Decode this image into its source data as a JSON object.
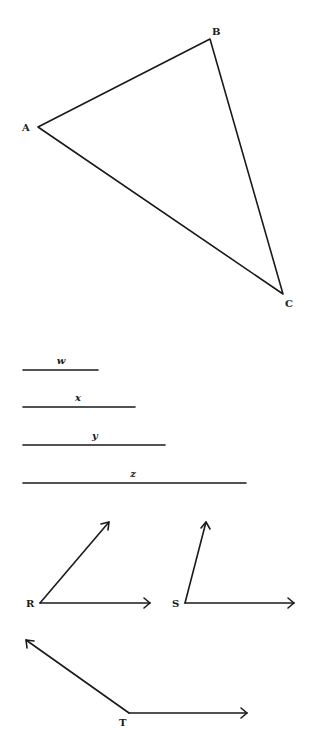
{
  "triangle": {
    "vertices": [
      {
        "label": "A",
        "x": 38,
        "y": 127,
        "lx": 22,
        "ly": 131
      },
      {
        "label": "B",
        "x": 210,
        "y": 39,
        "lx": 212,
        "ly": 35
      },
      {
        "label": "C",
        "x": 283,
        "y": 294,
        "lx": 285,
        "ly": 307
      }
    ]
  },
  "segments": [
    {
      "label": "w",
      "x1": 23,
      "x2": 98,
      "y": 370,
      "lx": 61,
      "ly": 364
    },
    {
      "label": "x",
      "x1": 23,
      "x2": 135,
      "y": 407,
      "lx": 78,
      "ly": 401
    },
    {
      "label": "y",
      "x1": 23,
      "x2": 165,
      "y": 445,
      "lx": 95,
      "ly": 439
    },
    {
      "label": "z",
      "x1": 23,
      "x2": 246,
      "y": 483,
      "lx": 133,
      "ly": 477
    }
  ],
  "angles": [
    {
      "label": "R",
      "vx": 40,
      "vy": 603,
      "r1": [
        150,
        603
      ],
      "r2": [
        109,
        522
      ],
      "lx": 26,
      "ly": 607
    },
    {
      "label": "S",
      "vx": 185,
      "vy": 603,
      "r1": [
        294,
        603
      ],
      "r2": [
        206,
        522
      ],
      "lx": 172,
      "ly": 607
    },
    {
      "label": "T",
      "vx": 129,
      "vy": 713,
      "r1": [
        247,
        713
      ],
      "r2": [
        26,
        640
      ],
      "lx": 119,
      "ly": 726
    }
  ]
}
